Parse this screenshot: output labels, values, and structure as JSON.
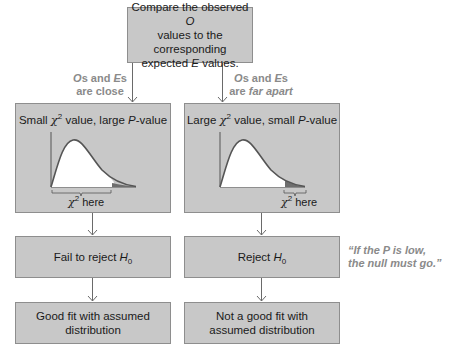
{
  "top_box": {
    "line1_pre": "Compare the observed ",
    "line1_var": "O",
    "line2": "values to the corresponding",
    "line3_pre": "expected ",
    "line3_var": "E",
    "line3_post": " values."
  },
  "branches": {
    "left": {
      "label_line1_a": "O",
      "label_line1_b": "s and ",
      "label_line1_c": "E",
      "label_line1_d": "s",
      "label_line2": "are close",
      "chart_title_pre": "Small ",
      "chart_title_chi": "χ",
      "chart_title_sup": "2",
      "chart_title_mid": " value, large ",
      "chart_title_p": "P",
      "chart_title_post": "-value",
      "here_chi": "χ",
      "here_sup": "2",
      "here_text": " here",
      "decision_pre": "Fail to reject ",
      "decision_var": "H",
      "decision_sub": "0",
      "result_line1": "Good fit with assumed",
      "result_line2": "distribution"
    },
    "right": {
      "label_line1_a": "O",
      "label_line1_b": "s and ",
      "label_line1_c": "E",
      "label_line1_d": "s",
      "label_line2_pre": "are ",
      "label_line2_em": "far apart",
      "chart_title_pre": "Large ",
      "chart_title_chi": "χ",
      "chart_title_sup": "2",
      "chart_title_mid": " value, small ",
      "chart_title_p": "P",
      "chart_title_post": "-value",
      "here_chi": "χ",
      "here_sup": "2",
      "here_text": " here",
      "decision_pre": "Reject ",
      "decision_var": "H",
      "decision_sub": "0",
      "result_line1": "Not a good fit with",
      "result_line2": "assumed distribution"
    }
  },
  "quote": {
    "line1": "“If the P is low,",
    "line2": "the null must go.”"
  },
  "colors": {
    "box_fill": "#c8c8c8",
    "box_border": "#8e8e8e",
    "curve_stroke": "#555555",
    "tail_fill": "#6e6e6e",
    "label_text": "#8a8a8a"
  }
}
